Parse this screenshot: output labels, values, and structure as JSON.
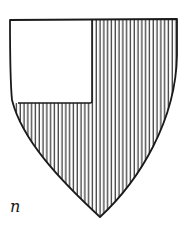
{
  "figure": {
    "label": "n",
    "field_tincture": "gules (vertical hatching)",
    "canton_tincture": "argent (plain white)"
  },
  "colors": {
    "ink": "#1a1a1a",
    "paper": "#ffffff"
  }
}
